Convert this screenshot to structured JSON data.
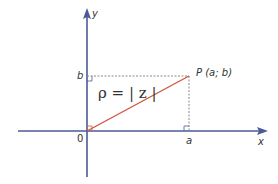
{
  "diagram": {
    "labels": {
      "y_axis": "y",
      "x_axis": "x",
      "origin": "0",
      "a": "a",
      "b": "b",
      "point": "P (a; b)",
      "rho": "ρ = | z |"
    },
    "colors": {
      "axis": "#4a5a96",
      "segment": "#d2553a",
      "dashed": "#888888",
      "text": "#333333"
    }
  }
}
